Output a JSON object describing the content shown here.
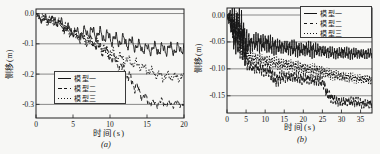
{
  "figure": {
    "bg_color": "#f7f7f5",
    "ink_color": "#1a1a1a"
  },
  "chart_data": [
    {
      "id": "a",
      "type": "line",
      "title": "",
      "caption": "(a)",
      "xlabel": "时间(s)",
      "ylabel": "侧移(m)",
      "xlim": [
        0,
        20
      ],
      "ylim": [
        -0.345,
        0.015
      ],
      "xticks": [
        0,
        5,
        10,
        15,
        20
      ],
      "xtick_labels": [
        "0",
        "5",
        "10",
        "15",
        "20"
      ],
      "yticks": [
        0,
        -0.1,
        -0.2,
        -0.3
      ],
      "ytick_labels": [
        "0.0",
        "-0.1",
        "-0.2",
        "-0.3"
      ],
      "grid": "horizontal",
      "legend_position": "inside-bottom-left",
      "osc_freqs": [
        0.95,
        2.3,
        4.6
      ],
      "samples": 460,
      "series": [
        {
          "name": "模型一",
          "style": "solid",
          "final_value": -0.11,
          "phase": [
            0.2,
            1.4,
            2.6
          ],
          "envelope": [
            [
              0,
              -0.005,
              0.008
            ],
            [
              0.5,
              -0.015,
              0.015
            ],
            [
              1,
              -0.02,
              0.02
            ],
            [
              2,
              -0.02,
              0.018
            ],
            [
              3,
              -0.025,
              0.02
            ],
            [
              4,
              -0.045,
              0.025
            ],
            [
              5,
              -0.06,
              0.02
            ],
            [
              6,
              -0.065,
              0.022
            ],
            [
              7,
              -0.06,
              0.026
            ],
            [
              8,
              -0.065,
              0.03
            ],
            [
              9,
              -0.072,
              0.03
            ],
            [
              10,
              -0.08,
              0.03
            ],
            [
              11,
              -0.088,
              0.028
            ],
            [
              12,
              -0.092,
              0.03
            ],
            [
              13,
              -0.1,
              0.03
            ],
            [
              14,
              -0.11,
              0.026
            ],
            [
              15,
              -0.118,
              0.025
            ],
            [
              16,
              -0.115,
              0.026
            ],
            [
              17,
              -0.12,
              0.03
            ],
            [
              18,
              -0.115,
              0.026
            ],
            [
              19,
              -0.12,
              0.027
            ],
            [
              20,
              -0.112,
              0.025
            ]
          ]
        },
        {
          "name": "模型二",
          "style": "dashed",
          "final_value": -0.3,
          "phase": [
            1.1,
            0.3,
            1.9
          ],
          "envelope": [
            [
              0,
              -0.005,
              0.008
            ],
            [
              1,
              -0.018,
              0.018
            ],
            [
              2,
              -0.022,
              0.018
            ],
            [
              3,
              -0.03,
              0.02
            ],
            [
              4,
              -0.05,
              0.022
            ],
            [
              5,
              -0.065,
              0.02
            ],
            [
              6,
              -0.08,
              0.02
            ],
            [
              7,
              -0.09,
              0.022
            ],
            [
              8,
              -0.1,
              0.025
            ],
            [
              9,
              -0.115,
              0.025
            ],
            [
              10,
              -0.14,
              0.026
            ],
            [
              11,
              -0.165,
              0.026
            ],
            [
              12,
              -0.195,
              0.03
            ],
            [
              13,
              -0.225,
              0.03
            ],
            [
              14,
              -0.26,
              0.025
            ],
            [
              15,
              -0.285,
              0.02
            ],
            [
              16,
              -0.3,
              0.016
            ],
            [
              17,
              -0.292,
              0.018
            ],
            [
              18,
              -0.3,
              0.016
            ],
            [
              19,
              -0.296,
              0.016
            ],
            [
              20,
              -0.3,
              0.014
            ]
          ]
        },
        {
          "name": "模型三",
          "style": "dotted",
          "final_value": -0.21,
          "phase": [
            2.3,
            1.7,
            0.6
          ],
          "envelope": [
            [
              0,
              -0.005,
              0.008
            ],
            [
              1,
              -0.018,
              0.018
            ],
            [
              2,
              -0.024,
              0.018
            ],
            [
              3,
              -0.032,
              0.02
            ],
            [
              4,
              -0.05,
              0.022
            ],
            [
              5,
              -0.065,
              0.02
            ],
            [
              6,
              -0.078,
              0.02
            ],
            [
              7,
              -0.088,
              0.022
            ],
            [
              8,
              -0.1,
              0.024
            ],
            [
              9,
              -0.115,
              0.024
            ],
            [
              10,
              -0.13,
              0.025
            ],
            [
              11,
              -0.142,
              0.024
            ],
            [
              12,
              -0.152,
              0.024
            ],
            [
              13,
              -0.162,
              0.022
            ],
            [
              14,
              -0.172,
              0.02
            ],
            [
              15,
              -0.185,
              0.02
            ],
            [
              16,
              -0.198,
              0.02
            ],
            [
              17,
              -0.208,
              0.02
            ],
            [
              18,
              -0.205,
              0.019
            ],
            [
              19,
              -0.213,
              0.018
            ],
            [
              20,
              -0.21,
              0.018
            ]
          ]
        }
      ]
    },
    {
      "id": "b",
      "type": "line",
      "title": "",
      "caption": "(b)",
      "xlabel": "时间(s)",
      "ylabel": "侧移(m)",
      "xlim": [
        0,
        38
      ],
      "ylim": [
        -0.182,
        0.013
      ],
      "xticks": [
        0,
        5,
        10,
        15,
        20,
        25,
        30,
        35
      ],
      "xtick_labels": [
        "0",
        "5",
        "10",
        "15",
        "20",
        "25",
        "30",
        "35"
      ],
      "yticks": [
        0,
        -0.05,
        -0.1,
        -0.15
      ],
      "ytick_labels": [
        "0.00",
        "-0.05",
        "-0.10",
        "-0.15"
      ],
      "grid": "horizontal",
      "legend_position": "inside-top-right",
      "osc_freqs": [
        1.6,
        3.7,
        7.1
      ],
      "samples": 1150,
      "series": [
        {
          "name": "模型一",
          "style": "solid",
          "final_value": -0.072,
          "phase": [
            0.5,
            1.2,
            2.2
          ],
          "envelope": [
            [
              0,
              -0.002,
              0.004
            ],
            [
              0.8,
              -0.008,
              0.02
            ],
            [
              1.3,
              -0.018,
              0.04
            ],
            [
              2,
              -0.028,
              0.05
            ],
            [
              2.6,
              -0.025,
              0.04
            ],
            [
              3.2,
              -0.03,
              0.048
            ],
            [
              4,
              -0.04,
              0.05
            ],
            [
              4.7,
              -0.055,
              0.05
            ],
            [
              5.4,
              -0.05,
              0.025
            ],
            [
              6.5,
              -0.053,
              0.016
            ],
            [
              8,
              -0.05,
              0.02
            ],
            [
              9.5,
              -0.052,
              0.02
            ],
            [
              11,
              -0.055,
              0.022
            ],
            [
              12.5,
              -0.058,
              0.018
            ],
            [
              14,
              -0.06,
              0.015
            ],
            [
              16,
              -0.06,
              0.016
            ],
            [
              18,
              -0.063,
              0.017
            ],
            [
              20,
              -0.064,
              0.015
            ],
            [
              22,
              -0.064,
              0.017
            ],
            [
              24,
              -0.066,
              0.013
            ],
            [
              26,
              -0.068,
              0.012
            ],
            [
              28,
              -0.071,
              0.011
            ],
            [
              30,
              -0.07,
              0.013
            ],
            [
              32,
              -0.071,
              0.012
            ],
            [
              34,
              -0.072,
              0.011
            ],
            [
              36,
              -0.072,
              0.011
            ],
            [
              38,
              -0.072,
              0.01
            ]
          ]
        },
        {
          "name": "模型二",
          "style": "dashed",
          "final_value": -0.165,
          "phase": [
            1.6,
            0.4,
            1.4
          ],
          "envelope": [
            [
              0,
              -0.002,
              0.004
            ],
            [
              1,
              -0.012,
              0.02
            ],
            [
              2,
              -0.028,
              0.04
            ],
            [
              3,
              -0.035,
              0.04
            ],
            [
              4,
              -0.05,
              0.04
            ],
            [
              4.8,
              -0.075,
              0.025
            ],
            [
              5.6,
              -0.092,
              0.014
            ],
            [
              7,
              -0.098,
              0.012
            ],
            [
              9,
              -0.1,
              0.012
            ],
            [
              11,
              -0.105,
              0.014
            ],
            [
              12,
              -0.115,
              0.018
            ],
            [
              13,
              -0.12,
              0.015
            ],
            [
              14.5,
              -0.115,
              0.012
            ],
            [
              16,
              -0.114,
              0.012
            ],
            [
              18,
              -0.116,
              0.012
            ],
            [
              20,
              -0.118,
              0.012
            ],
            [
              22,
              -0.12,
              0.012
            ],
            [
              24,
              -0.122,
              0.012
            ],
            [
              25.3,
              -0.126,
              0.013
            ],
            [
              26.2,
              -0.145,
              0.014
            ],
            [
              27.5,
              -0.155,
              0.012
            ],
            [
              29,
              -0.16,
              0.01
            ],
            [
              31,
              -0.162,
              0.01
            ],
            [
              33,
              -0.16,
              0.011
            ],
            [
              35,
              -0.164,
              0.01
            ],
            [
              38,
              -0.165,
              0.01
            ]
          ]
        },
        {
          "name": "模型三",
          "style": "dotted",
          "final_value": -0.12,
          "phase": [
            2.8,
            2.0,
            0.9
          ],
          "envelope": [
            [
              0,
              -0.002,
              0.004
            ],
            [
              1,
              -0.01,
              0.018
            ],
            [
              2,
              -0.025,
              0.035
            ],
            [
              3,
              -0.032,
              0.035
            ],
            [
              4,
              -0.048,
              0.035
            ],
            [
              4.8,
              -0.065,
              0.022
            ],
            [
              5.6,
              -0.078,
              0.013
            ],
            [
              7,
              -0.08,
              0.012
            ],
            [
              9,
              -0.083,
              0.012
            ],
            [
              11,
              -0.086,
              0.013
            ],
            [
              13,
              -0.09,
              0.013
            ],
            [
              15,
              -0.092,
              0.012
            ],
            [
              17,
              -0.094,
              0.012
            ],
            [
              19,
              -0.097,
              0.012
            ],
            [
              21,
              -0.1,
              0.012
            ],
            [
              23,
              -0.102,
              0.012
            ],
            [
              25,
              -0.105,
              0.012
            ],
            [
              27,
              -0.11,
              0.011
            ],
            [
              29,
              -0.113,
              0.01
            ],
            [
              31,
              -0.115,
              0.011
            ],
            [
              33,
              -0.117,
              0.01
            ],
            [
              35,
              -0.119,
              0.01
            ],
            [
              38,
              -0.12,
              0.01
            ]
          ]
        }
      ]
    }
  ]
}
